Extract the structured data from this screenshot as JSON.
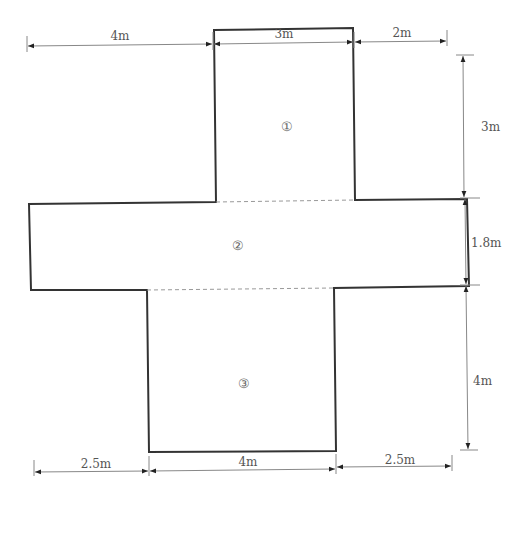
{
  "diagram": {
    "type": "cross-shaped floor plan with dimensions",
    "regions": [
      {
        "id": "region-1",
        "label": "①"
      },
      {
        "id": "region-2",
        "label": "②"
      },
      {
        "id": "region-3",
        "label": "③"
      }
    ],
    "dimensions": {
      "top": [
        "4m",
        "3m",
        "2m"
      ],
      "right": [
        "3m",
        "1.8m",
        "4m"
      ],
      "bottom": [
        "2.5m",
        "4m",
        "2.5m"
      ]
    },
    "colors": {
      "outline": "#333333",
      "dimension_line": "#888888",
      "dashed": "#999999",
      "text": "#555555"
    }
  }
}
